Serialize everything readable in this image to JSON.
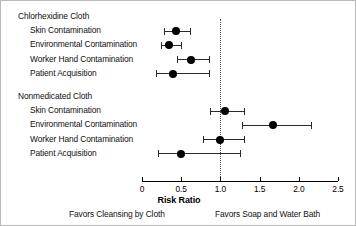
{
  "chart_data": {
    "type": "scatter",
    "subtype": "forest-plot",
    "title": "",
    "xlabel": "Risk Ratio",
    "ylabel": "",
    "xlim": [
      0,
      2.5
    ],
    "xticks": [
      0,
      0.5,
      1.0,
      1.5,
      2.0,
      2.5
    ],
    "xticklabels": [
      "0",
      "0.5",
      "1.0",
      "1.5",
      "2.0",
      "2.5"
    ],
    "grid": false,
    "reference_line": 1.0,
    "reference_line_style": "dotted",
    "legend": "none",
    "annotations": [
      "Favors Cleansing by Cloth",
      "Favors Soap and Water Bath"
    ],
    "groups": [
      {
        "name": "Chlorhexidine Cloth",
        "rows": [
          {
            "label": "Skin Contamination",
            "estimate": 0.43,
            "ci_low": 0.28,
            "ci_high": 0.61
          },
          {
            "label": "Environmental Contamination",
            "estimate": 0.35,
            "ci_low": 0.24,
            "ci_high": 0.5
          },
          {
            "label": "Worker Hand Contamination",
            "estimate": 0.63,
            "ci_low": 0.45,
            "ci_high": 0.86
          },
          {
            "label": "Patient Acquisition",
            "estimate": 0.4,
            "ci_low": 0.18,
            "ci_high": 0.86
          }
        ]
      },
      {
        "name": "Nonmedicated Cloth",
        "rows": [
          {
            "label": "Skin Contamination",
            "estimate": 1.06,
            "ci_low": 0.87,
            "ci_high": 1.3
          },
          {
            "label": "Environmental Contamination",
            "estimate": 1.67,
            "ci_low": 1.28,
            "ci_high": 2.16
          },
          {
            "label": "Worker Hand Contamination",
            "estimate": 1.0,
            "ci_low": 0.78,
            "ci_high": 1.3
          },
          {
            "label": "Patient Acquisition",
            "estimate": 0.5,
            "ci_low": 0.2,
            "ci_high": 1.25
          }
        ]
      }
    ]
  },
  "footnotes": {
    "left": "Favors Cleansing by Cloth",
    "right": "Favors Soap and Water Bath"
  },
  "axis": {
    "title": "Risk Ratio"
  },
  "colors": {
    "marker": "#000000",
    "ci_line": "#2a2a2a",
    "axis": "#000000",
    "reference": "#4d4d4d",
    "text": "#111111",
    "background": "#ffffff",
    "frame": "#b9b9b9"
  }
}
